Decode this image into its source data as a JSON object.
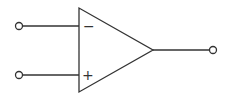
{
  "diagram": {
    "type": "op-amp symbol",
    "inverting_input_label": "−",
    "non_inverting_input_label": "+",
    "stroke_color": "#333333",
    "background": "#ffffff",
    "terminals": [
      "inverting-input",
      "non-inverting-input",
      "output"
    ]
  }
}
